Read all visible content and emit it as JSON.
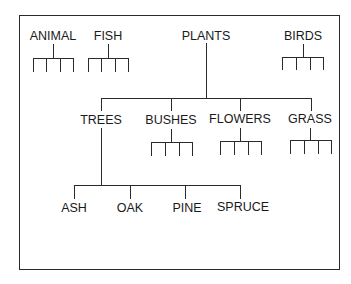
{
  "diagram": {
    "type": "hierarchy",
    "top_level": [
      "ANIMAL",
      "FISH",
      "PLANTS",
      "BIRDS"
    ],
    "nodes": {
      "animal": "ANIMAL",
      "fish": "FISH",
      "plants": "PLANTS",
      "birds": "BIRDS",
      "trees": "TREES",
      "bushes": "BUSHES",
      "flowers": "FLOWERS",
      "grass": "GRASS",
      "ash": "ASH",
      "oak": "OAK",
      "pine": "PINE",
      "spruce": "SPRUCE"
    },
    "edges": [
      [
        "PLANTS",
        "TREES"
      ],
      [
        "PLANTS",
        "BUSHES"
      ],
      [
        "PLANTS",
        "FLOWERS"
      ],
      [
        "PLANTS",
        "GRASS"
      ],
      [
        "TREES",
        "ASH"
      ],
      [
        "TREES",
        "OAK"
      ],
      [
        "TREES",
        "PINE"
      ],
      [
        "TREES",
        "SPRUCE"
      ]
    ],
    "unlabeled_child_stubs": {
      "ANIMAL": 4,
      "FISH": 4,
      "BIRDS": 4,
      "BUSHES": 4,
      "FLOWERS": 4,
      "GRASS": 4
    }
  }
}
